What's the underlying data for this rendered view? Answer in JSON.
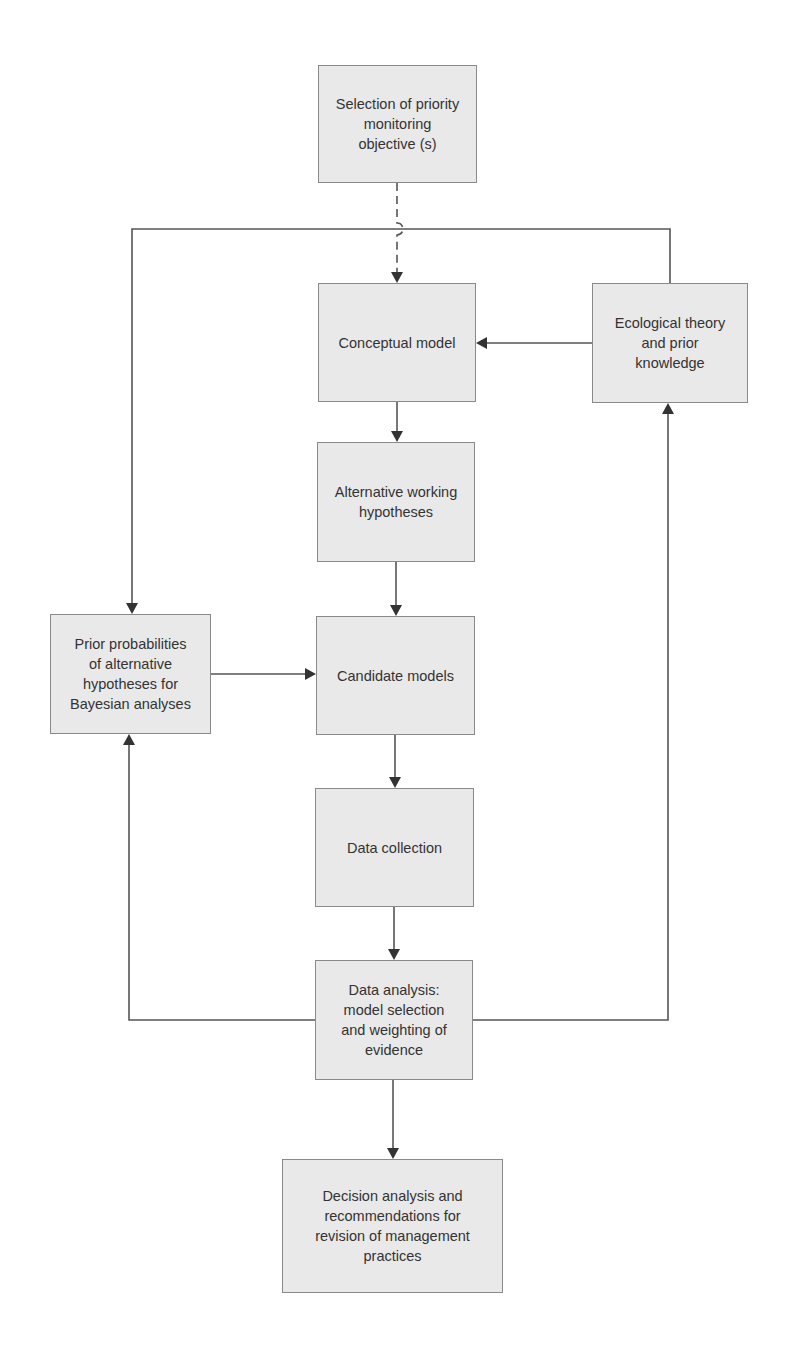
{
  "diagram": {
    "type": "flowchart",
    "colors": {
      "box_fill": "#e9e9e9",
      "box_border": "#8a8a8a",
      "line": "#555555",
      "text": "#333333"
    },
    "nodes": [
      {
        "id": "objective",
        "label": "Selection of priority\nmonitoring\nobjective (s)",
        "x": 318,
        "y": 65,
        "w": 159,
        "h": 118
      },
      {
        "id": "conceptual",
        "label": "Conceptual model",
        "x": 318,
        "y": 283,
        "w": 158,
        "h": 119
      },
      {
        "id": "ecological",
        "label": "Ecological theory\nand prior\nknowledge",
        "x": 592,
        "y": 283,
        "w": 156,
        "h": 120
      },
      {
        "id": "alternative",
        "label": "Alternative working\nhypotheses",
        "x": 317,
        "y": 442,
        "w": 158,
        "h": 120
      },
      {
        "id": "prior",
        "label": "Prior probabilities\nof alternative\nhypotheses for\nBayesian analyses",
        "x": 50,
        "y": 614,
        "w": 161,
        "h": 120
      },
      {
        "id": "candidate",
        "label": "Candidate models",
        "x": 316,
        "y": 616,
        "w": 159,
        "h": 119
      },
      {
        "id": "collection",
        "label": "Data collection",
        "x": 315,
        "y": 788,
        "w": 159,
        "h": 119
      },
      {
        "id": "analysis",
        "label": "Data analysis:\nmodel selection\nand weighting of\nevidence",
        "x": 315,
        "y": 960,
        "w": 158,
        "h": 120
      },
      {
        "id": "decision",
        "label": "Decision analysis and\nrecommendations for\nrevision of management\npractices",
        "x": 282,
        "y": 1159,
        "w": 221,
        "h": 134
      }
    ],
    "edges": [
      {
        "from": "objective",
        "to": "conceptual",
        "style": "dashed",
        "points": [
          [
            397,
            183
          ],
          [
            397,
            283
          ]
        ],
        "arrow": true,
        "hop_at": [
          397,
          229
        ]
      },
      {
        "from": "ecological",
        "to": "prior",
        "style": "solid",
        "points": [
          [
            670,
            283
          ],
          [
            670,
            229
          ],
          [
            132,
            229
          ],
          [
            132,
            614
          ]
        ],
        "arrow": true
      },
      {
        "from": "ecological",
        "to": "conceptual",
        "style": "solid",
        "points": [
          [
            592,
            343
          ],
          [
            476,
            343
          ]
        ],
        "arrow": true
      },
      {
        "from": "conceptual",
        "to": "alternative",
        "style": "solid",
        "points": [
          [
            397,
            402
          ],
          [
            397,
            442
          ]
        ],
        "arrow": true
      },
      {
        "from": "alternative",
        "to": "candidate",
        "style": "solid",
        "points": [
          [
            396,
            562
          ],
          [
            396,
            616
          ]
        ],
        "arrow": true
      },
      {
        "from": "prior",
        "to": "candidate",
        "style": "solid",
        "points": [
          [
            211,
            674
          ],
          [
            316,
            674
          ]
        ],
        "arrow": true
      },
      {
        "from": "candidate",
        "to": "collection",
        "style": "solid",
        "points": [
          [
            395,
            735
          ],
          [
            395,
            788
          ]
        ],
        "arrow": true
      },
      {
        "from": "collection",
        "to": "analysis",
        "style": "solid",
        "points": [
          [
            394,
            907
          ],
          [
            394,
            960
          ]
        ],
        "arrow": true
      },
      {
        "from": "analysis",
        "to": "prior",
        "style": "solid",
        "points": [
          [
            315,
            1020
          ],
          [
            129,
            1020
          ],
          [
            129,
            734
          ]
        ],
        "arrow": true
      },
      {
        "from": "analysis",
        "to": "ecological",
        "style": "solid",
        "points": [
          [
            473,
            1020
          ],
          [
            668,
            1020
          ],
          [
            668,
            403
          ]
        ],
        "arrow": true
      },
      {
        "from": "analysis",
        "to": "decision",
        "style": "solid",
        "points": [
          [
            393,
            1080
          ],
          [
            393,
            1159
          ]
        ],
        "arrow": true
      }
    ]
  }
}
